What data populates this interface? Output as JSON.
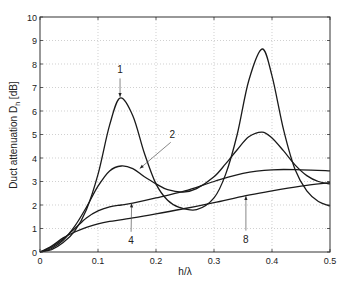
{
  "chart_data": {
    "type": "line",
    "title": "",
    "xlabel": "h/λ",
    "ylabel": "Duct attenuation D_h [dB]",
    "ylabel_main": "Duct attenuation D",
    "ylabel_sub": "h",
    "ylabel_unit": " [dB]",
    "xlim": [
      0,
      0.5
    ],
    "ylim": [
      0,
      10
    ],
    "xticks": [
      0,
      0.1,
      0.2,
      0.3,
      0.4,
      0.5
    ],
    "xtick_labels": [
      "0",
      "0.1",
      "0.2",
      "0.3",
      "0.4",
      "0.5"
    ],
    "yticks": [
      0,
      1,
      2,
      3,
      4,
      5,
      6,
      7,
      8,
      9,
      10
    ],
    "ytick_labels": [
      "0",
      "1",
      "2",
      "3",
      "4",
      "5",
      "6",
      "7",
      "8",
      "9",
      "10"
    ],
    "grid": true,
    "legend": "none (curves labeled by annotations)",
    "series": [
      {
        "name": "1",
        "x": [
          0,
          0.02,
          0.04,
          0.06,
          0.08,
          0.1,
          0.12,
          0.138,
          0.16,
          0.18,
          0.2,
          0.22,
          0.24,
          0.27,
          0.3,
          0.32,
          0.34,
          0.36,
          0.383,
          0.4,
          0.42,
          0.44,
          0.46,
          0.48,
          0.5
        ],
        "y": [
          0,
          0.1,
          0.4,
          0.9,
          1.8,
          3.3,
          5.4,
          6.55,
          5.8,
          4.2,
          2.9,
          2.2,
          1.9,
          1.8,
          2.3,
          3.3,
          5.0,
          7.3,
          8.64,
          7.5,
          5.2,
          3.5,
          2.6,
          2.15,
          1.96
        ]
      },
      {
        "name": "2",
        "x": [
          0,
          0.02,
          0.04,
          0.06,
          0.08,
          0.1,
          0.12,
          0.14,
          0.16,
          0.18,
          0.2,
          0.22,
          0.247,
          0.27,
          0.3,
          0.32,
          0.34,
          0.36,
          0.383,
          0.4,
          0.42,
          0.44,
          0.46,
          0.48,
          0.5
        ],
        "y": [
          0,
          0.15,
          0.5,
          1.1,
          1.9,
          2.8,
          3.45,
          3.66,
          3.55,
          3.2,
          2.9,
          2.65,
          2.55,
          2.7,
          3.2,
          3.75,
          4.35,
          4.9,
          5.1,
          4.85,
          4.3,
          3.7,
          3.25,
          3.0,
          2.9
        ]
      },
      {
        "name": "4",
        "x": [
          0,
          0.02,
          0.04,
          0.06,
          0.08,
          0.1,
          0.12,
          0.14,
          0.16,
          0.2,
          0.25,
          0.3,
          0.35,
          0.4,
          0.45,
          0.5
        ],
        "y": [
          0,
          0.2,
          0.55,
          1.0,
          1.45,
          1.75,
          1.92,
          2.0,
          2.08,
          2.3,
          2.6,
          3.0,
          3.35,
          3.5,
          3.5,
          3.45
        ]
      },
      {
        "name": "8",
        "x": [
          0,
          0.02,
          0.04,
          0.06,
          0.08,
          0.1,
          0.12,
          0.16,
          0.2,
          0.25,
          0.3,
          0.355,
          0.4,
          0.45,
          0.5
        ],
        "y": [
          0,
          0.25,
          0.6,
          0.85,
          1.05,
          1.2,
          1.3,
          1.45,
          1.62,
          1.85,
          2.1,
          2.4,
          2.6,
          2.8,
          2.95
        ]
      }
    ],
    "annotations": [
      {
        "text": "1",
        "label_x": 0.138,
        "label_y": 7.6,
        "arrow_to_x": 0.138,
        "arrow_to_y": 6.6
      },
      {
        "text": "2",
        "label_x": 0.228,
        "label_y": 4.85,
        "arrow_to_x": 0.172,
        "arrow_to_y": 3.55
      },
      {
        "text": "4",
        "label_x": 0.157,
        "label_y": 0.35,
        "arrow_to_x": 0.158,
        "arrow_to_y": 2.07
      },
      {
        "text": "8",
        "label_x": 0.355,
        "label_y": 0.4,
        "arrow_to_x": 0.355,
        "arrow_to_y": 2.38
      }
    ]
  }
}
